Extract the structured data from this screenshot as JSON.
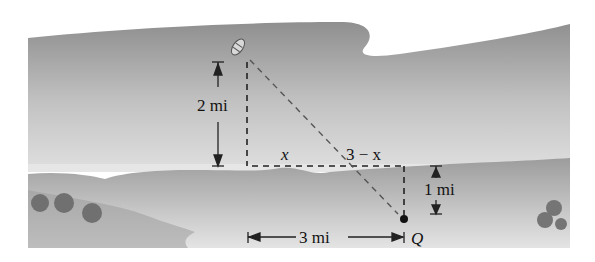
{
  "diagram": {
    "type": "boat-to-shore optimization illustration",
    "colors": {
      "far_bank": "#a9a9a9",
      "water_light": "#e6e6e6",
      "near_bank": "#b4b4b4",
      "bushes": "#6f6f6f",
      "lines": "#222222"
    },
    "labels": {
      "vertical_distance": "2 mi",
      "segment_x": "x",
      "segment_remaining": "3 − x",
      "inland_distance": "1 mi",
      "horizontal_distance": "3 mi",
      "point": "Q"
    },
    "icons": {
      "boat": "boat-icon",
      "point_q": "dot-marker"
    }
  }
}
